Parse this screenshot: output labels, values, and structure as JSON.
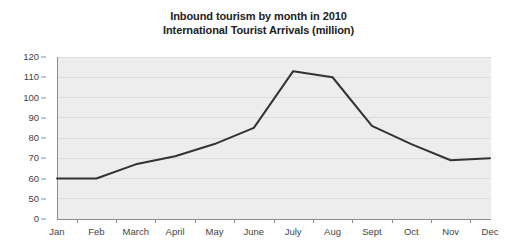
{
  "chart_data": {
    "type": "line",
    "title": "Inbound tourism by month in 2010",
    "subtitle": "International Tourist Arrivals (million)",
    "title_lines": [
      "Inbound tourism by month in 2010",
      "International Tourist Arrivals (million)"
    ],
    "xlabel": "",
    "ylabel": "",
    "categories": [
      "Jan",
      "Feb",
      "March",
      "April",
      "May",
      "June",
      "July",
      "Aug",
      "Sept",
      "Oct",
      "Nov",
      "Dec"
    ],
    "values": [
      60,
      60,
      67,
      71,
      77,
      85,
      113,
      110,
      86,
      77,
      69,
      70
    ],
    "series": [
      {
        "name": "International Tourist Arrivals (million)",
        "values": [
          60,
          60,
          67,
          71,
          77,
          85,
          113,
          110,
          86,
          77,
          69,
          70
        ]
      }
    ],
    "y_ticks": [
      0,
      50,
      60,
      70,
      80,
      90,
      100,
      110,
      120
    ],
    "ylim": [
      0,
      120
    ],
    "axis_break": true,
    "axis_break_note": "Y axis is broken: 0 is plotted one tick step below 50",
    "grid": "horizontal",
    "legend": "none",
    "units": "million",
    "colors": {
      "line": "#333333",
      "plot_background": "#ededed",
      "page_background": "#ffffff",
      "gridline": "#dcdcdc",
      "axis": "#8c8c8c",
      "title_text": "#222222",
      "tick_text": "#444444"
    }
  }
}
